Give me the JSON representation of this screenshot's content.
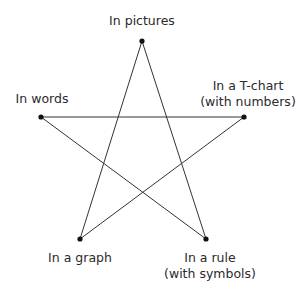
{
  "diagram": {
    "type": "five-point star (pentagram) of representations",
    "nodes": [
      {
        "id": "top",
        "label_lines": [
          "In pictures"
        ],
        "x": 142,
        "y": 41
      },
      {
        "id": "right",
        "label_lines": [
          "In a T-chart",
          "(with numbers)"
        ],
        "x": 244,
        "y": 117
      },
      {
        "id": "bottom_right",
        "label_lines": [
          "In a rule",
          "(with symbols)"
        ],
        "x": 206,
        "y": 239
      },
      {
        "id": "bottom_left",
        "label_lines": [
          "In a graph"
        ],
        "x": 80,
        "y": 239
      },
      {
        "id": "left",
        "label_lines": [
          "In words"
        ],
        "x": 41,
        "y": 117
      }
    ],
    "edges": [
      [
        "top",
        "bottom_left"
      ],
      [
        "top",
        "bottom_right"
      ],
      [
        "left",
        "right"
      ],
      [
        "left",
        "bottom_right"
      ],
      [
        "right",
        "bottom_left"
      ]
    ],
    "line_color": "#333333",
    "dot_color": "#111111"
  }
}
